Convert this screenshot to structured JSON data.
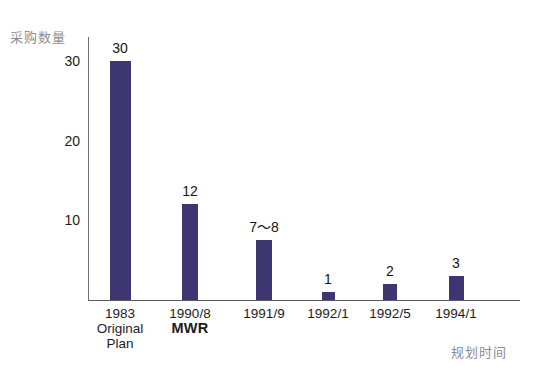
{
  "chart_data": {
    "type": "bar",
    "title": "",
    "subtitle": "",
    "xlabel": "规划时间",
    "ylabel": "采购数量",
    "categories": [
      "1983 Original Plan",
      "1990/8 MWR",
      "1991/9",
      "1992/1",
      "1992/5",
      "1994/1"
    ],
    "values": [
      30,
      12,
      7.5,
      1,
      2,
      3
    ],
    "data_labels": [
      "30",
      "12",
      "7～8",
      "1",
      "2",
      "3"
    ],
    "ylim": [
      0,
      33
    ],
    "yticks": [
      10,
      20,
      30
    ],
    "ytick_labels": [
      "10",
      "20",
      "30"
    ],
    "grid": false,
    "legend": false,
    "bar_color": "#3d3670",
    "axis_color": "#5a5a60",
    "axis_title_color": "#8c8c8c",
    "background": "#ffffff"
  },
  "axes": {
    "y_title": "采购数量",
    "x_title": "规划时间",
    "y_ticks": [
      {
        "label": "30",
        "value": 30
      },
      {
        "label": "20",
        "value": 20
      },
      {
        "label": "10",
        "value": 10
      }
    ]
  },
  "bars": [
    {
      "name": "bar-1983",
      "value_label": "30",
      "value": 30,
      "category_lines": [
        "1983",
        "Original",
        "Plan"
      ],
      "category_bold": [
        false,
        false,
        false
      ]
    },
    {
      "name": "bar-1990-08",
      "value_label": "12",
      "value": 12,
      "category_lines": [
        "1990/8",
        "MWR"
      ],
      "category_bold": [
        false,
        true
      ]
    },
    {
      "name": "bar-1991-09",
      "value_label": "7～8",
      "value": 7.5,
      "category_lines": [
        "1991/9"
      ],
      "category_bold": [
        false
      ]
    },
    {
      "name": "bar-1992-01",
      "value_label": "1",
      "value": 1,
      "category_lines": [
        "1992/1"
      ],
      "category_bold": [
        false
      ]
    },
    {
      "name": "bar-1992-05",
      "value_label": "2",
      "value": 2,
      "category_lines": [
        "1992/5"
      ],
      "category_bold": [
        false
      ]
    },
    {
      "name": "bar-1994-01",
      "value_label": "3",
      "value": 3,
      "category_lines": [
        "1994/1"
      ],
      "category_bold": [
        false
      ]
    }
  ]
}
